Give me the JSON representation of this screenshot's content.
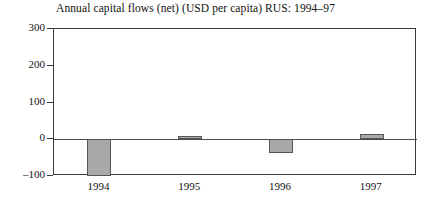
{
  "chart_data": {
    "type": "bar",
    "title": "Annual capital flows (net) (USD per capita) RUS: 1994–97",
    "xlabel": "",
    "ylabel": "",
    "categories": [
      "1994",
      "1995",
      "1996",
      "1997"
    ],
    "values": [
      -100,
      8,
      -38,
      14
    ],
    "ylim": [
      -100,
      300
    ],
    "yticks": [
      300,
      200,
      100,
      0,
      -100
    ],
    "ytick_labels": [
      "300",
      "200",
      "100",
      "0",
      "–100"
    ],
    "grid": false,
    "legend": null,
    "bar_color": "#a9a9a9",
    "bar_edge_color": "#555555",
    "axis_color": "#3a3a3a",
    "zero_line": 0
  },
  "figure": {
    "background": "#ffffff",
    "text_color": "#111111"
  }
}
